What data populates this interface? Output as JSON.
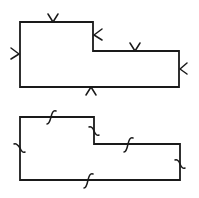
{
  "figure": {
    "line_color": "#1a1a1a",
    "background": "#ffffff",
    "shapes": [
      {
        "name": "chevron-marked-polygon",
        "marker_type": "chevron",
        "edges": [
          {
            "side": "top-left",
            "marker": "chevron-down"
          },
          {
            "side": "inner-vertical",
            "marker": "chevron-left"
          },
          {
            "side": "top-right",
            "marker": "chevron-down"
          },
          {
            "side": "right",
            "marker": "chevron-left"
          },
          {
            "side": "bottom",
            "marker": "chevron-up"
          },
          {
            "side": "left",
            "marker": "chevron-right"
          }
        ]
      },
      {
        "name": "squiggle-marked-polygon",
        "marker_type": "integral-squiggle",
        "edges": [
          {
            "side": "top-left",
            "marker": "squiggle"
          },
          {
            "side": "inner-vertical",
            "marker": "squiggle"
          },
          {
            "side": "top-right",
            "marker": "squiggle"
          },
          {
            "side": "right",
            "marker": "squiggle"
          },
          {
            "side": "bottom",
            "marker": "squiggle"
          },
          {
            "side": "left",
            "marker": "squiggle"
          }
        ]
      }
    ]
  }
}
